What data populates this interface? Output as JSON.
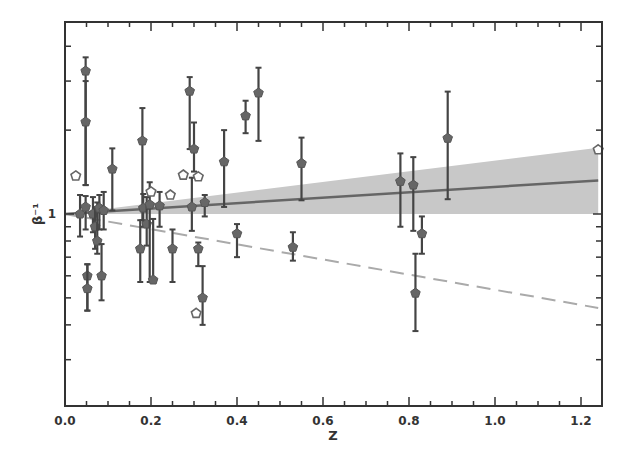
{
  "chart_data": {
    "type": "scatter",
    "title": "",
    "xlabel": "Z",
    "ylabel": "β⁻¹",
    "xlim": [
      0.0,
      1.24
    ],
    "ylim": [
      0.205,
      4.9
    ],
    "yscale": "log",
    "grid": false,
    "legend": null,
    "x_ticks": [
      0.0,
      0.2,
      0.4,
      0.6,
      0.8,
      1.0,
      1.2
    ],
    "x_tick_labels": [
      "0.0",
      "0.2",
      "0.4",
      "0.6",
      "0.8",
      "1.0",
      "1.2"
    ],
    "x_minor_step": 0.05,
    "y_tick_labels": [
      {
        "value": 1,
        "label": "1"
      }
    ],
    "y_minor_ticks": [
      0.3,
      0.4,
      0.5,
      0.6,
      0.7,
      0.8,
      0.9,
      2,
      3,
      4
    ],
    "series": [
      {
        "name": "measurements (filled, with error bars)",
        "marker": "filled-pentagon",
        "color": "#555555",
        "points": [
          {
            "z": 0.035,
            "v": 1.0,
            "lo": 0.83,
            "hi": 1.17
          },
          {
            "z": 0.048,
            "v": 3.26,
            "lo": 1.27,
            "hi": 3.65
          },
          {
            "z": 0.048,
            "v": 2.14,
            "lo": 1.27,
            "hi": 3.0
          },
          {
            "z": 0.048,
            "v": 1.06,
            "lo": 0.88,
            "hi": 1.16
          },
          {
            "z": 0.052,
            "v": 0.6,
            "lo": 0.45,
            "hi": 0.66
          },
          {
            "z": 0.052,
            "v": 0.54,
            "lo": 0.45,
            "hi": 0.66
          },
          {
            "z": 0.065,
            "v": 1.0,
            "lo": 0.86,
            "hi": 1.15
          },
          {
            "z": 0.07,
            "v": 0.9,
            "lo": 0.75,
            "hi": 1.06
          },
          {
            "z": 0.075,
            "v": 0.8,
            "lo": 0.72,
            "hi": 1.1
          },
          {
            "z": 0.08,
            "v": 1.05,
            "lo": 0.88,
            "hi": 1.17
          },
          {
            "z": 0.085,
            "v": 0.6,
            "lo": 0.49,
            "hi": 0.78
          },
          {
            "z": 0.09,
            "v": 1.03,
            "lo": 0.88,
            "hi": 1.2
          },
          {
            "z": 0.11,
            "v": 1.45,
            "lo": 1.03,
            "hi": 1.72
          },
          {
            "z": 0.175,
            "v": 0.75,
            "lo": 0.57,
            "hi": 0.95
          },
          {
            "z": 0.18,
            "v": 1.83,
            "lo": 0.95,
            "hi": 2.4
          },
          {
            "z": 0.182,
            "v": 1.05,
            "lo": 0.9,
            "hi": 1.18
          },
          {
            "z": 0.19,
            "v": 0.92,
            "lo": 0.77,
            "hi": 1.15
          },
          {
            "z": 0.197,
            "v": 1.08,
            "lo": 0.57,
            "hi": 1.3
          },
          {
            "z": 0.205,
            "v": 0.58,
            "lo": 0.57,
            "hi": 0.96
          },
          {
            "z": 0.22,
            "v": 1.07,
            "lo": 0.9,
            "hi": 1.2
          },
          {
            "z": 0.25,
            "v": 0.75,
            "lo": 0.57,
            "hi": 0.88
          },
          {
            "z": 0.29,
            "v": 2.76,
            "lo": 1.71,
            "hi": 3.1
          },
          {
            "z": 0.295,
            "v": 1.06,
            "lo": 0.87,
            "hi": 1.35
          },
          {
            "z": 0.3,
            "v": 1.71,
            "lo": 1.42,
            "hi": 2.13
          },
          {
            "z": 0.31,
            "v": 0.75,
            "lo": 0.65,
            "hi": 0.79
          },
          {
            "z": 0.32,
            "v": 0.5,
            "lo": 0.4,
            "hi": 0.65
          },
          {
            "z": 0.325,
            "v": 1.1,
            "lo": 0.98,
            "hi": 1.17
          },
          {
            "z": 0.37,
            "v": 1.54,
            "lo": 1.06,
            "hi": 2.0
          },
          {
            "z": 0.4,
            "v": 0.85,
            "lo": 0.7,
            "hi": 0.92
          },
          {
            "z": 0.42,
            "v": 2.25,
            "lo": 1.95,
            "hi": 2.55
          },
          {
            "z": 0.45,
            "v": 2.72,
            "lo": 1.83,
            "hi": 3.35
          },
          {
            "z": 0.53,
            "v": 0.76,
            "lo": 0.68,
            "hi": 0.86
          },
          {
            "z": 0.55,
            "v": 1.52,
            "lo": 1.12,
            "hi": 1.88
          },
          {
            "z": 0.78,
            "v": 1.31,
            "lo": 0.9,
            "hi": 1.65
          },
          {
            "z": 0.81,
            "v": 1.27,
            "lo": 0.87,
            "hi": 1.6
          },
          {
            "z": 0.815,
            "v": 0.52,
            "lo": 0.38,
            "hi": 0.72
          },
          {
            "z": 0.83,
            "v": 0.85,
            "lo": 0.72,
            "hi": 0.98
          },
          {
            "z": 0.89,
            "v": 1.87,
            "lo": 1.13,
            "hi": 2.75
          }
        ]
      },
      {
        "name": "open pentagons",
        "marker": "open-pentagon",
        "color": "#555555",
        "points": [
          {
            "z": 0.025,
            "v": 1.37
          },
          {
            "z": 0.2,
            "v": 1.2
          },
          {
            "z": 0.245,
            "v": 1.17
          },
          {
            "z": 0.275,
            "v": 1.38
          },
          {
            "z": 0.31,
            "v": 1.36
          },
          {
            "z": 0.305,
            "v": 0.44
          },
          {
            "z": 1.24,
            "v": 1.7
          }
        ]
      },
      {
        "name": "best fit",
        "style": "solid",
        "color": "#666666",
        "x": [
          0.0,
          1.24
        ],
        "y": [
          1.0,
          1.32
        ]
      },
      {
        "name": "confidence band",
        "style": "fill",
        "color": "#c8c8c8",
        "x": [
          0.0,
          1.24
        ],
        "y_lower": [
          1.0,
          1.0
        ],
        "y_upper": [
          1.0,
          1.73
        ]
      },
      {
        "name": "reference (dashed)",
        "style": "dashed",
        "color": "#aaaaaa",
        "x": [
          0.0,
          1.24
        ],
        "y": [
          1.0,
          0.46
        ]
      }
    ]
  }
}
